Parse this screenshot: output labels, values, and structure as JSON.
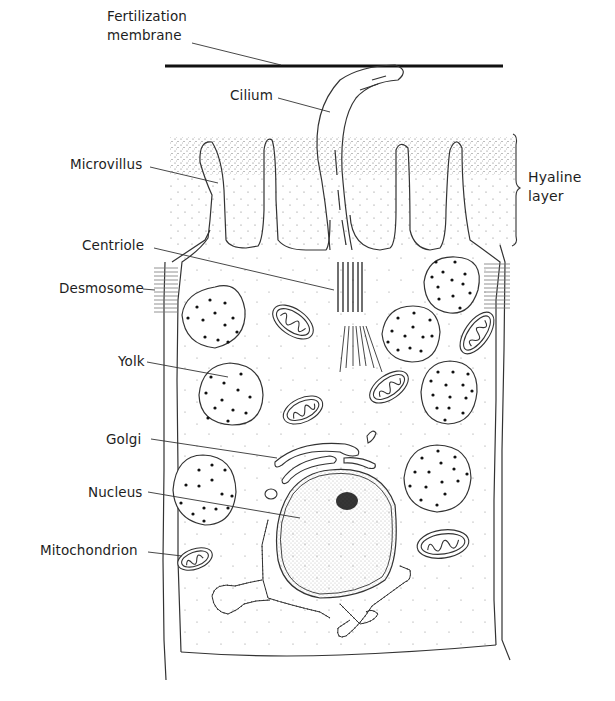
{
  "diagram": {
    "labels": {
      "fertilization_membrane_1": "Fertilization",
      "fertilization_membrane_2": "membrane",
      "cilium": "Cilium",
      "microvillus": "Microvillus",
      "hyaline_1": "Hyaline",
      "hyaline_2": "layer",
      "centriole": "Centriole",
      "desmosome": "Desmosome",
      "yolk": "Yolk",
      "golgi": "Golgi",
      "nucleus": "Nucleus",
      "mitochondrion": "Mitochondrion"
    },
    "colors": {
      "ink": "#222222",
      "stipple": "#555555",
      "background": "#ffffff"
    }
  }
}
